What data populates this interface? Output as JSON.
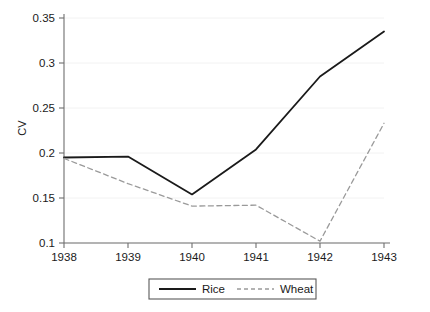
{
  "chart_data": {
    "type": "line",
    "title": "",
    "subtitle": "",
    "xlabel": "",
    "ylabel": "CV",
    "x": [
      1938,
      1939,
      1940,
      1941,
      1942,
      1943
    ],
    "categories": [
      "1938",
      "1939",
      "1940",
      "1941",
      "1942",
      "1943"
    ],
    "xtick_labels": [
      "1938",
      "1939",
      "1940",
      "1941",
      "1942",
      "1943"
    ],
    "ytick_labels": [
      "0.1",
      "0.15",
      "0.2",
      "0.25",
      "0.3",
      "0.35"
    ],
    "ytick_values": [
      0.1,
      0.15,
      0.2,
      0.25,
      0.3,
      0.35
    ],
    "xlim": [
      1938,
      1943
    ],
    "ylim": [
      0.1,
      0.35
    ],
    "grid": true,
    "legend_position": "bottom",
    "series": [
      {
        "name": "Rice",
        "values": [
          0.195,
          0.196,
          0.154,
          0.204,
          0.285,
          0.335
        ],
        "style": "solid",
        "color": "#1a1a1a"
      },
      {
        "name": "Wheat",
        "values": [
          0.194,
          0.166,
          0.141,
          0.142,
          0.102,
          0.233
        ],
        "style": "dashed",
        "color": "#9a9a9a"
      }
    ]
  },
  "legend": {
    "items": [
      {
        "label": "Rice"
      },
      {
        "label": "Wheat"
      }
    ]
  },
  "colors": {
    "rice_line": "#1a1a1a",
    "wheat_line": "#9a9a9a",
    "axis": "#6e6e6e",
    "grid": "#f2f2f2",
    "legend_border": "#5a5a5a",
    "background": "#ffffff"
  }
}
